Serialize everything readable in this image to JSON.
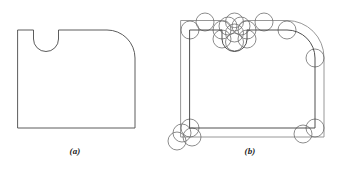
{
  "figure": {
    "panels": [
      {
        "id": "a",
        "caption": "(a)",
        "description": "Original closed profile: rectangle with a semicircular U-notch in the top edge and a rounded top-right corner",
        "stroke_color": "#4a4a4a",
        "stroke_width": 0.9,
        "outline_path": "M 18 30 L 33.5 30 L 33.5 39 A 12.5 12.5 0 0 0 58.5 39 L 58.5 30 L 107 30 A 28 28 0 0 1 135 58 L 135 128 L 18 128 Z",
        "geometry": {
          "left_x": 18,
          "right_x": 135,
          "top_y": 30,
          "bottom_y": 128,
          "notch_left_x": 33.5,
          "notch_right_x": 58.5,
          "notch_shoulder_y": 39,
          "notch_radius": 12.5,
          "corner_radius": 28
        }
      },
      {
        "id": "b",
        "caption": "(b)",
        "description": "Same profile with an outward offset contour and construction circles of constant radius rolled along every vertex and arc endpoint",
        "original_color": "#3c3c3c",
        "offset_color": "#8c8c8c",
        "circle_color": "#6e6e6e",
        "stroke_width": 0.9,
        "offset_distance": 9,
        "circle_radius": 9,
        "original_path": "M 190 30 L 222 30 L 222 39 A 12.5 12.5 0 0 0 247 39 L 247 30 L 287 30 A 28 28 0 0 1 315 58 L 315 128 L 190 128 Z",
        "offset_path": "M 181 20.5 L 222.5 20.5 A 9 9 0 0 1 231 27 A 12.5 12.5 0 0 0 238.5 27 A 9 9 0 0 1 246.5 20.5 L 287 20.5 A 37 37 0 0 1 324 57.5 L 324 137 L 181 137 Z",
        "construction_circles": [
          {
            "cx": 190,
            "cy": 30,
            "r": 9,
            "at": "top-left-corner"
          },
          {
            "cx": 205,
            "cy": 22,
            "r": 9,
            "at": "top-edge-left"
          },
          {
            "cx": 222,
            "cy": 30,
            "r": 9,
            "at": "notch-left-shoulder"
          },
          {
            "cx": 222,
            "cy": 39,
            "r": 9,
            "at": "notch-left-arc-start"
          },
          {
            "cx": 228,
            "cy": 26,
            "r": 9,
            "at": "notch-cluster-1"
          },
          {
            "cx": 234.5,
            "cy": 22,
            "r": 9,
            "at": "notch-center-top"
          },
          {
            "cx": 234.5,
            "cy": 33,
            "r": 9,
            "at": "notch-center"
          },
          {
            "cx": 234.5,
            "cy": 42,
            "r": 9,
            "at": "notch-bottom"
          },
          {
            "cx": 241,
            "cy": 26,
            "r": 9,
            "at": "notch-cluster-2"
          },
          {
            "cx": 247,
            "cy": 39,
            "r": 9,
            "at": "notch-right-arc-start"
          },
          {
            "cx": 247,
            "cy": 30,
            "r": 9,
            "at": "notch-right-shoulder"
          },
          {
            "cx": 264,
            "cy": 22,
            "r": 9,
            "at": "top-edge-right"
          },
          {
            "cx": 287,
            "cy": 30,
            "r": 9,
            "at": "fillet-arc-start"
          },
          {
            "cx": 315,
            "cy": 58,
            "r": 9,
            "at": "fillet-arc-end"
          },
          {
            "cx": 190,
            "cy": 128,
            "r": 9,
            "at": "bottom-left-corner"
          },
          {
            "cx": 182,
            "cy": 133,
            "r": 9,
            "at": "bottom-left-cluster-1"
          },
          {
            "cx": 177,
            "cy": 141,
            "r": 9,
            "at": "bottom-left-cluster-2"
          },
          {
            "cx": 192,
            "cy": 137,
            "r": 9,
            "at": "bottom-left-cluster-3"
          },
          {
            "cx": 315,
            "cy": 128,
            "r": 9,
            "at": "bottom-right-corner"
          },
          {
            "cx": 303,
            "cy": 134,
            "r": 9,
            "at": "bottom-right-cluster"
          }
        ]
      }
    ]
  }
}
